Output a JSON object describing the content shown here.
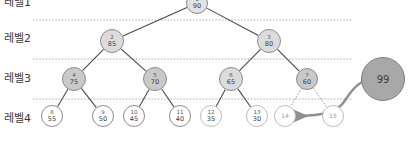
{
  "diagram": {
    "title_hidden_top_label": "레벨1",
    "level_labels": [
      {
        "id": "level1",
        "text": "레벨1",
        "x": 4,
        "y": -3
      },
      {
        "id": "level2",
        "text": "레벨2",
        "x": 4,
        "y": 33
      },
      {
        "id": "level3",
        "text": "레벨3",
        "x": 4,
        "y": 73
      },
      {
        "id": "level4",
        "text": "레벨4",
        "x": 4,
        "y": 113
      }
    ],
    "separators": [
      {
        "id": "sep-1-2",
        "y": 20,
        "x1": 33,
        "x2": 352
      },
      {
        "id": "sep-2-3",
        "y": 59,
        "x1": 33,
        "x2": 352
      },
      {
        "id": "sep-3-4",
        "y": 99,
        "x1": 33,
        "x2": 352
      }
    ],
    "colors": {
      "node_root_fill": "#e2e2e2",
      "node_level2_fill": "#e0e0e0",
      "node_level3_fill_dark": "#c9c9c9",
      "node_level3_fill_light": "#dcdcdc",
      "node_level4_fill": "#ffffff",
      "node_stroke": "#8c8c8c",
      "node_empty_stroke": "#bdbdbd",
      "insert_node_fill": "#a8a8a8",
      "insert_node_stroke": "#7d7d7d",
      "edge_color": "#4a4a4a",
      "dotted_edge_color": "#8a8a8a",
      "arrow_color": "#8f8f8f",
      "separator_color": "#9a9a9a",
      "text_color": "#3a3a3a"
    },
    "nodes": [
      {
        "id": "n1",
        "index": "1",
        "value": "90",
        "cx": 197,
        "cy": 3,
        "r": 11,
        "level": 1,
        "style": "root",
        "filled": true
      },
      {
        "id": "n2",
        "index": "2",
        "value": "85",
        "cx": 112,
        "cy": 41,
        "r": 12,
        "level": 2,
        "style": "light",
        "filled": true
      },
      {
        "id": "n3",
        "index": "3",
        "value": "80",
        "cx": 269,
        "cy": 41,
        "r": 12,
        "level": 2,
        "style": "light",
        "filled": true
      },
      {
        "id": "n4",
        "index": "4",
        "value": "75",
        "cx": 74,
        "cy": 79,
        "r": 12,
        "level": 3,
        "style": "dark",
        "filled": true
      },
      {
        "id": "n5",
        "index": "5",
        "value": "70",
        "cx": 155,
        "cy": 79,
        "r": 12,
        "level": 3,
        "style": "dark",
        "filled": true
      },
      {
        "id": "n6",
        "index": "6",
        "value": "65",
        "cx": 231,
        "cy": 79,
        "r": 12,
        "level": 3,
        "style": "light",
        "filled": true
      },
      {
        "id": "n7",
        "index": "7",
        "value": "60",
        "cx": 307,
        "cy": 79,
        "r": 11,
        "level": 3,
        "style": "dark",
        "filled": true
      },
      {
        "id": "n8",
        "index": "8",
        "value": "55",
        "cx": 52,
        "cy": 116,
        "r": 11,
        "level": 4,
        "style": "white",
        "filled": false
      },
      {
        "id": "n9",
        "index": "9",
        "value": "50",
        "cx": 103,
        "cy": 116,
        "r": 11,
        "level": 4,
        "style": "white",
        "filled": false
      },
      {
        "id": "n10",
        "index": "10",
        "value": "45",
        "cx": 134,
        "cy": 116,
        "r": 11,
        "level": 4,
        "style": "white",
        "filled": false
      },
      {
        "id": "n11",
        "index": "11",
        "value": "40",
        "cx": 180,
        "cy": 116,
        "r": 11,
        "level": 4,
        "style": "white",
        "filled": false
      },
      {
        "id": "n12",
        "index": "12",
        "value": "35",
        "cx": 211,
        "cy": 116,
        "r": 11,
        "level": 4,
        "style": "white-faded",
        "filled": false
      },
      {
        "id": "n13",
        "index": "13",
        "value": "30",
        "cx": 257,
        "cy": 116,
        "r": 11,
        "level": 4,
        "style": "white-faded",
        "filled": false
      },
      {
        "id": "n14",
        "index": "14",
        "value": "",
        "cx": 285,
        "cy": 116,
        "r": 11,
        "level": 4,
        "style": "empty",
        "filled": false
      },
      {
        "id": "n15",
        "index": "15",
        "value": "",
        "cx": 333,
        "cy": 116,
        "r": 11,
        "level": 4,
        "style": "empty",
        "filled": false
      }
    ],
    "insert_node": {
      "id": "n99",
      "value": "99",
      "cx": 383,
      "cy": 79,
      "r": 22
    },
    "edges": [
      {
        "id": "e1-2",
        "from": "n1",
        "to": "n2",
        "style": "solid"
      },
      {
        "id": "e1-3",
        "from": "n1",
        "to": "n3",
        "style": "solid"
      },
      {
        "id": "e2-4",
        "from": "n2",
        "to": "n4",
        "style": "solid"
      },
      {
        "id": "e2-5",
        "from": "n2",
        "to": "n5",
        "style": "solid"
      },
      {
        "id": "e3-6",
        "from": "n3",
        "to": "n6",
        "style": "solid"
      },
      {
        "id": "e3-7",
        "from": "n3",
        "to": "n7",
        "style": "solid"
      },
      {
        "id": "e4-8",
        "from": "n4",
        "to": "n8",
        "style": "solid"
      },
      {
        "id": "e4-9",
        "from": "n4",
        "to": "n9",
        "style": "solid"
      },
      {
        "id": "e5-10",
        "from": "n5",
        "to": "n10",
        "style": "solid"
      },
      {
        "id": "e5-11",
        "from": "n5",
        "to": "n11",
        "style": "solid"
      },
      {
        "id": "e6-12",
        "from": "n6",
        "to": "n12",
        "style": "solid"
      },
      {
        "id": "e6-13",
        "from": "n6",
        "to": "n13",
        "style": "solid"
      },
      {
        "id": "e7-14",
        "from": "n7",
        "to": "n14",
        "style": "dotted"
      },
      {
        "id": "e7-15",
        "from": "n7",
        "to": "n15",
        "style": "dotted"
      }
    ],
    "insert_arrow": {
      "id": "insert-arrow",
      "path": "M 362 82 C 345 92 348 106 330 112 C 318 116 305 116 294 116",
      "target_node": "n14"
    }
  }
}
